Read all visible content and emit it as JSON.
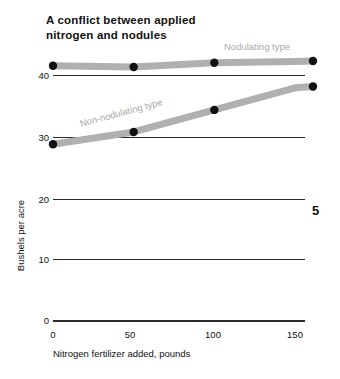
{
  "figure": {
    "title": "A conflict between applied\nnitrogen and nodules",
    "number": "5",
    "band_color": "#b0b0b0",
    "marker_color": "#111111",
    "axis_color": "#2b2b2b",
    "label_color": "#a9a9a9"
  },
  "chart_data": {
    "type": "line",
    "title": "A conflict between applied nitrogen and nodules",
    "xlabel": "Nitrogen fertilizer added, pounds",
    "ylabel": "Bushels per acre",
    "x": [
      0,
      50,
      100,
      150
    ],
    "xticklabels": [
      "0",
      "50",
      "100",
      "150"
    ],
    "yticklabels": [
      "0",
      "10",
      "20",
      "30",
      "40"
    ],
    "yticks": [
      0,
      10,
      20,
      30,
      40
    ],
    "xlim": [
      0,
      160
    ],
    "ylim": [
      0,
      44
    ],
    "grid": "horizontal",
    "legend": "inline-labels",
    "series": [
      {
        "name": "Nodulating type",
        "values": [
          41.5,
          41.3,
          42.0,
          42.2
        ],
        "color": "#b0b0b0"
      },
      {
        "name": "Non-nodulating type",
        "values": [
          28.7,
          30.7,
          34.3,
          37.9
        ],
        "color": "#b0b0b0"
      }
    ]
  },
  "axis": {
    "y_ticks": [
      {
        "label": "40",
        "top": 75
      },
      {
        "label": "30",
        "top": 137
      },
      {
        "label": "20",
        "top": 199
      },
      {
        "label": "10",
        "top": 259
      },
      {
        "label": "0",
        "top": 320
      }
    ],
    "x_ticks": [
      {
        "label": "0",
        "left": 53
      },
      {
        "label": "50",
        "left": 130
      },
      {
        "label": "100",
        "left": 213
      },
      {
        "label": "150",
        "left": 295
      }
    ],
    "x_title": "Nitrogen fertilizer added, pounds",
    "y_title": "Bushels per acre"
  },
  "series_labels": {
    "nodulating": "Nodulating type",
    "non_nodulating": "Non-nodulating type"
  }
}
